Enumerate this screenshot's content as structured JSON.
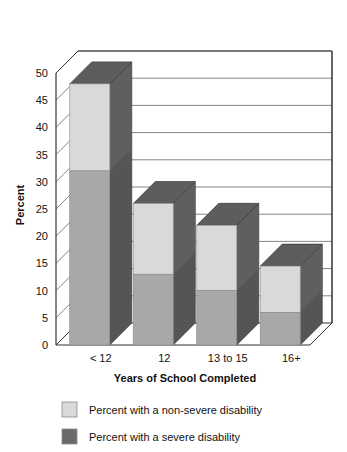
{
  "chart_data": {
    "type": "bar",
    "title": "",
    "subtitle": "",
    "xlabel": "Years of School Completed",
    "ylabel": "Percent",
    "categories": [
      "< 12",
      "12",
      "13 to 15",
      "16+"
    ],
    "series": [
      {
        "name": "Percent with a severe disability",
        "values": [
          32,
          13,
          10,
          6
        ],
        "color": "#a8a8a8"
      },
      {
        "name": "Percent with a non-severe disability",
        "values": [
          16,
          13,
          12,
          8.5
        ],
        "color": "#d9d9d9"
      }
    ],
    "totals": [
      48,
      26,
      22,
      14.5
    ],
    "stacked": true,
    "three_d": true,
    "ylim": [
      0,
      50
    ],
    "ytick_labels": [
      "0",
      "5",
      "10",
      "15",
      "20",
      "25",
      "30",
      "35",
      "40",
      "45",
      "50"
    ],
    "ytick_values": [
      0,
      5,
      10,
      15,
      20,
      25,
      30,
      35,
      40,
      45,
      50
    ],
    "grid": true,
    "grid_axis": "y",
    "legend_position": "bottom-left",
    "legend_entries": [
      {
        "label": "Percent with a non-severe disability",
        "color": "#d9d9d9"
      },
      {
        "label": "Percent with a severe disability",
        "color": "#a8a8a8"
      }
    ]
  },
  "colors": {
    "light_front": "#d9d9d9",
    "mid_front": "#a8a8a8",
    "dark_side": "#555555",
    "dark_top": "#5d5d5d",
    "light_side": "#8f8f8f",
    "axis_line": "#333333",
    "grid_line": "#666666",
    "legend_light": "#d9d9d9",
    "legend_dark": "#6a6a6a"
  },
  "legend": {
    "item_nonsevere": "Percent with a non-severe disability",
    "item_severe": "Percent with a severe disability"
  },
  "axis": {
    "y_title": "Percent",
    "x_title": "Years of School Completed",
    "y_ticks": [
      "50",
      "45",
      "40",
      "35",
      "30",
      "25",
      "20",
      "15",
      "10",
      "5",
      "0"
    ],
    "x_ticks": [
      "< 12",
      "12",
      "13 to 15",
      "16+"
    ]
  }
}
